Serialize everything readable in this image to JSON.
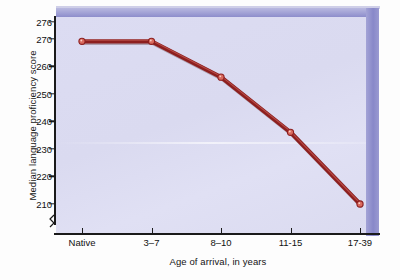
{
  "chart_data": {
    "type": "line",
    "title": "",
    "xlabel": "Age of arrival, in years",
    "ylabel": "Median language proficiency score",
    "categories": [
      "Native",
      "3–7",
      "8–10",
      "11-15",
      "17-39"
    ],
    "values": [
      269,
      269,
      256,
      236,
      210
    ],
    "series": [
      {
        "name": "Median language proficiency score",
        "values": [
          269,
          269,
          256,
          236,
          210
        ]
      }
    ],
    "yticks": [
      276,
      270,
      260,
      250,
      240,
      230,
      220,
      210
    ],
    "ylim": [
      204,
      276
    ],
    "y_axis_break": true,
    "grid": false,
    "legend": "none",
    "marker": "circle",
    "line_color": "#8d1f1f",
    "marker_face_color": "#d96a5e",
    "plot_background": "#dcdcf2",
    "bevel_color": "#8888c9"
  },
  "axis": {
    "y_labels": [
      "276",
      "270",
      "260",
      "250",
      "240",
      "230",
      "220",
      "210"
    ],
    "x_labels": [
      "Native",
      "3–7",
      "8–10",
      "11-15",
      "17-39"
    ],
    "y_title": "Median language proficiency score",
    "x_title": "Age of arrival, in years"
  }
}
